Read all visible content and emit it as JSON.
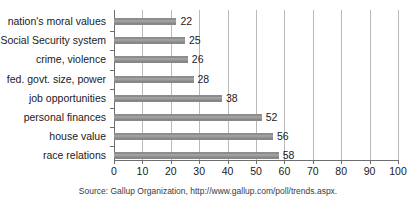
{
  "chart_data": {
    "type": "bar",
    "orientation": "horizontal",
    "title": "",
    "xlabel": "",
    "ylabel": "",
    "xlim": [
      0,
      100
    ],
    "xticks": [
      0,
      10,
      20,
      30,
      40,
      50,
      60,
      70,
      80,
      90,
      100
    ],
    "grid": true,
    "legend": null,
    "bar_color": "#8d8d8d",
    "axis_color": "#6e6e6e",
    "gridline_color": "#b9b9b9",
    "categories": [
      "nation's moral values",
      "Social Security system",
      "crime, violence",
      "fed. govt. size, power",
      "job opportunities",
      "personal finances",
      "house value",
      "race relations"
    ],
    "values": [
      22,
      25,
      26,
      28,
      38,
      52,
      56,
      58
    ],
    "value_labels": [
      "22",
      "25",
      "26",
      "28",
      "38",
      "52",
      "56",
      "58"
    ],
    "tick_labels": [
      "0",
      "10",
      "20",
      "30",
      "40",
      "50",
      "60",
      "70",
      "80",
      "90",
      "100"
    ],
    "annotations": [
      "Source: Gallup Organization, http://www.gallup.com/poll/trends.aspx."
    ]
  },
  "footer": {
    "source": "Source: Gallup Organization, http://www.gallup.com/poll/trends.aspx."
  }
}
